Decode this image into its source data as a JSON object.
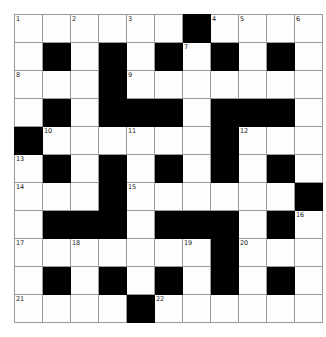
{
  "puzzle": {
    "title": "Crossword Grid",
    "rows": 11,
    "cols": 11,
    "colors": {
      "block": "#000000",
      "cell": "#fdfdfd",
      "gridline": "#9a9a9a",
      "number": "#1a1a1a",
      "page_background": "#ffffff"
    },
    "grid": [
      [
        "white",
        "white",
        "white",
        "white",
        "white",
        "white",
        "block",
        "white",
        "white",
        "white",
        "white"
      ],
      [
        "white",
        "block",
        "white",
        "block",
        "white",
        "block",
        "white",
        "block",
        "white",
        "block",
        "white"
      ],
      [
        "white",
        "white",
        "white",
        "block",
        "white",
        "white",
        "white",
        "white",
        "white",
        "white",
        "white"
      ],
      [
        "white",
        "block",
        "white",
        "block",
        "block",
        "block",
        "white",
        "block",
        "block",
        "block",
        "white"
      ],
      [
        "block",
        "white",
        "white",
        "white",
        "white",
        "white",
        "white",
        "block",
        "white",
        "white",
        "white"
      ],
      [
        "white",
        "block",
        "white",
        "block",
        "white",
        "block",
        "white",
        "block",
        "white",
        "block",
        "white"
      ],
      [
        "white",
        "white",
        "white",
        "block",
        "white",
        "white",
        "white",
        "white",
        "white",
        "white",
        "block"
      ],
      [
        "white",
        "block",
        "block",
        "block",
        "white",
        "block",
        "block",
        "block",
        "white",
        "block",
        "white"
      ],
      [
        "white",
        "white",
        "white",
        "white",
        "white",
        "white",
        "white",
        "block",
        "white",
        "white",
        "white"
      ],
      [
        "white",
        "block",
        "white",
        "block",
        "white",
        "block",
        "white",
        "block",
        "white",
        "block",
        "white"
      ],
      [
        "white",
        "white",
        "white",
        "white",
        "block",
        "white",
        "white",
        "white",
        "white",
        "white",
        "white"
      ]
    ],
    "numbers": [
      {
        "row": 0,
        "col": 0,
        "label": "1"
      },
      {
        "row": 0,
        "col": 2,
        "label": "2"
      },
      {
        "row": 0,
        "col": 4,
        "label": "3"
      },
      {
        "row": 0,
        "col": 7,
        "label": "4"
      },
      {
        "row": 0,
        "col": 8,
        "label": "5"
      },
      {
        "row": 0,
        "col": 10,
        "label": "6"
      },
      {
        "row": 1,
        "col": 6,
        "label": "7"
      },
      {
        "row": 2,
        "col": 0,
        "label": "8"
      },
      {
        "row": 2,
        "col": 4,
        "label": "9"
      },
      {
        "row": 4,
        "col": 1,
        "label": "10"
      },
      {
        "row": 4,
        "col": 4,
        "label": "11"
      },
      {
        "row": 4,
        "col": 8,
        "label": "12"
      },
      {
        "row": 5,
        "col": 0,
        "label": "13"
      },
      {
        "row": 6,
        "col": 0,
        "label": "14"
      },
      {
        "row": 6,
        "col": 4,
        "label": "15"
      },
      {
        "row": 7,
        "col": 10,
        "label": "16"
      },
      {
        "row": 8,
        "col": 0,
        "label": "17"
      },
      {
        "row": 8,
        "col": 2,
        "label": "18"
      },
      {
        "row": 8,
        "col": 6,
        "label": "19"
      },
      {
        "row": 8,
        "col": 8,
        "label": "20"
      },
      {
        "row": 10,
        "col": 0,
        "label": "21"
      },
      {
        "row": 10,
        "col": 5,
        "label": "22"
      }
    ],
    "entries": []
  }
}
